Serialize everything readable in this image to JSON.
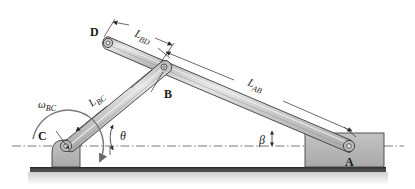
{
  "figure": {
    "kind": "mechanism-kinematic-diagram",
    "background_color": "#ffffff",
    "title": ""
  },
  "colors": {
    "link_fill": "#c9c9c9",
    "link_highlight": "#e4e4e4",
    "link_edge": "#3a3a3a",
    "block_fill": "#b8b8b8",
    "block_edge": "#444444",
    "ground_fill": "#4a4a4a",
    "ground_shadow": "#d8d8d8",
    "centerline": "#555555",
    "dimension_line": "#2b2b2b",
    "text": "#1a1a1a"
  },
  "joints": [
    {
      "id": "A",
      "label": "A",
      "x": 349,
      "y": 146,
      "label_x": 350,
      "label_y": 164
    },
    {
      "id": "B",
      "label": "B",
      "x": 163,
      "y": 67,
      "label_x": 168,
      "label_y": 96
    },
    {
      "id": "C",
      "label": "C",
      "x": 66,
      "y": 146,
      "label_x": 43,
      "label_y": 136
    },
    {
      "id": "D",
      "label": "D",
      "x": 108,
      "y": 43,
      "label_x": 96,
      "label_y": 33
    }
  ],
  "links": [
    {
      "id": "AB",
      "from": "A",
      "to": "B",
      "label": "L",
      "sub": "AB"
    },
    {
      "id": "BC",
      "from": "B",
      "to": "C",
      "label": "L",
      "sub": "BC"
    },
    {
      "id": "BD",
      "from": "B",
      "to": "D",
      "label": "L",
      "sub": "BD"
    }
  ],
  "dimensions": [
    {
      "id": "L_AB",
      "label": "L",
      "sub": "AB",
      "label_x": 258,
      "label_y": 81
    },
    {
      "id": "L_BC",
      "label": "L",
      "sub": "BC",
      "label_x": 95,
      "label_y": 102
    },
    {
      "id": "L_BD",
      "label": "L",
      "sub": "BD",
      "label_x": 143,
      "label_y": 33
    }
  ],
  "angles": [
    {
      "id": "theta",
      "label": "θ",
      "at": "C",
      "measured_from": "horizontal-centerline",
      "label_x": 121,
      "label_y": 139
    },
    {
      "id": "beta",
      "label": "β",
      "at": "A",
      "measured_from": "horizontal-centerline",
      "label_x": 263,
      "label_y": 144
    }
  ],
  "annotations": [
    {
      "id": "omega_BC",
      "label": "ω",
      "sub": "BC",
      "kind": "angular-velocity",
      "label_x": 45,
      "label_y": 108,
      "direction": "curved-arrow-clockwise-about-C"
    }
  ],
  "supports": [
    {
      "id": "support-C",
      "shape": "pedestal-rounded-corner"
    },
    {
      "id": "support-A",
      "shape": "rectangular-block"
    }
  ],
  "ground": {
    "id": "ground-line",
    "description": "horizontal hatched ground bar"
  },
  "centerline": {
    "id": "horizontal-centerline",
    "style": "dash-dot"
  }
}
